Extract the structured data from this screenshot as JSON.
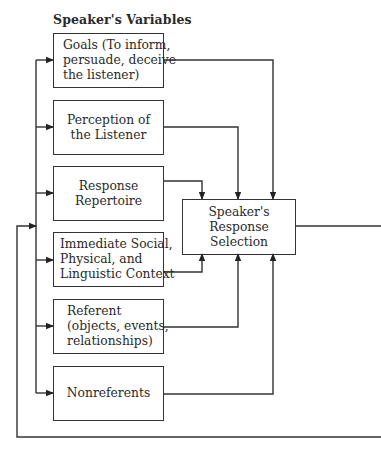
{
  "diagram": {
    "title": "Speaker's Variables",
    "variables": [
      {
        "id": "goals",
        "lines": [
          "Goals (To inform,",
          "persuade, deceive",
          "the listener)"
        ],
        "align": "left"
      },
      {
        "id": "perception",
        "lines": [
          "Perception of",
          "the Listener"
        ],
        "align": "center"
      },
      {
        "id": "repertoire",
        "lines": [
          "Response",
          "Repertoire"
        ],
        "align": "center"
      },
      {
        "id": "context",
        "lines": [
          "Immediate Social,",
          "Physical, and",
          "Linguistic Context"
        ],
        "align": "left"
      },
      {
        "id": "referent",
        "lines": [
          "Referent",
          "(objects, events,",
          "relationships)"
        ],
        "align": "left"
      },
      {
        "id": "nonreferents",
        "lines": [
          "Nonreferents"
        ],
        "align": "center"
      }
    ],
    "output": {
      "lines": [
        "Speaker's",
        "Response",
        "Selection"
      ]
    },
    "edges": [
      {
        "from": "goals",
        "to": "output"
      },
      {
        "from": "perception",
        "to": "output"
      },
      {
        "from": "repertoire",
        "to": "output"
      },
      {
        "from": "context",
        "to": "output"
      },
      {
        "from": "referent",
        "to": "output"
      },
      {
        "from": "nonreferents",
        "to": "output"
      },
      {
        "from": "output",
        "to": "feedback-loop"
      },
      {
        "from": "feedback-loop",
        "to": "all-variables"
      }
    ]
  }
}
